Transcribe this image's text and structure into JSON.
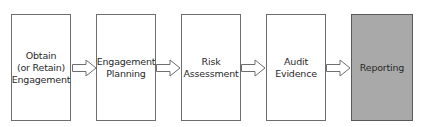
{
  "diagram": {
    "type": "process-flow",
    "direction": "left-to-right",
    "steps": [
      {
        "label": "Obtain\n(or Retain)\nEngagement",
        "lines": [
          "Obtain",
          "(or Retain)",
          "Engagement"
        ],
        "shaded": false
      },
      {
        "label": "Engagement\nPlanning",
        "lines": [
          "Engagement",
          "Planning"
        ],
        "shaded": false
      },
      {
        "label": "Risk\nAssessment",
        "lines": [
          "Risk",
          "Assessment"
        ],
        "shaded": false
      },
      {
        "label": "Audit\nEvidence",
        "lines": [
          "Audit",
          "Evidence"
        ],
        "shaded": false
      },
      {
        "label": "Reporting",
        "lines": [
          "Reporting"
        ],
        "shaded": true
      }
    ],
    "connectors": [
      {
        "from": 0,
        "to": 1,
        "style": "hollow-block-arrow"
      },
      {
        "from": 1,
        "to": 2,
        "style": "hollow-block-arrow"
      },
      {
        "from": 2,
        "to": 3,
        "style": "hollow-block-arrow"
      },
      {
        "from": 3,
        "to": 4,
        "style": "hollow-block-arrow"
      }
    ],
    "colors": {
      "box_fill": "#ffffff",
      "highlight_fill": "#a9a9a9",
      "border": "#6e6e6e"
    }
  }
}
